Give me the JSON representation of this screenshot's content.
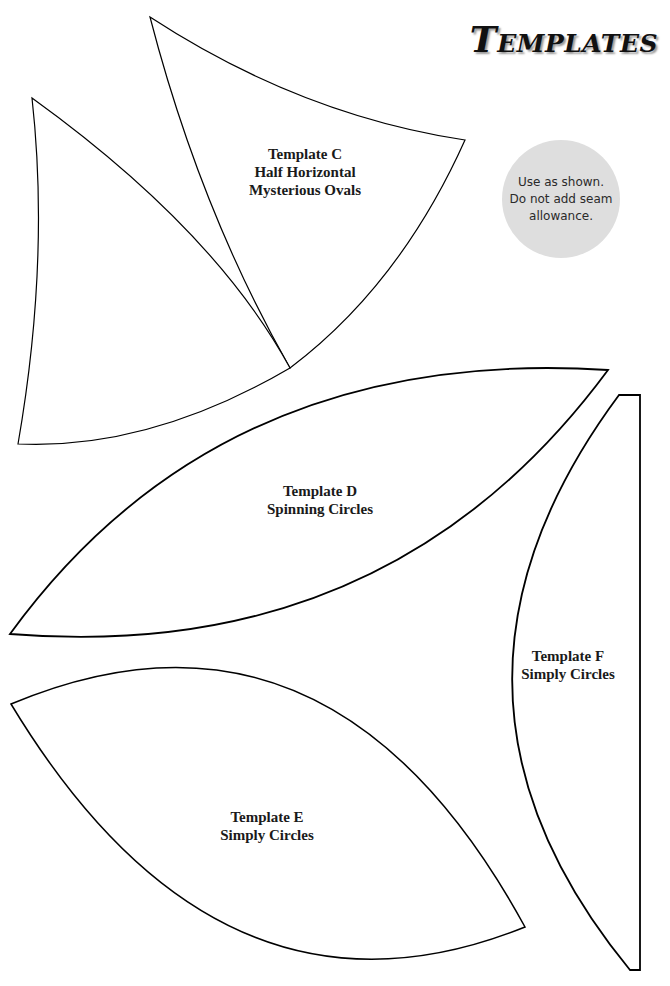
{
  "page": {
    "title": "Templates",
    "note": {
      "lines": [
        "Use as shown.",
        "Do not add seam",
        "allowance."
      ],
      "background": "#dedede"
    }
  },
  "templates": [
    {
      "id": "C",
      "name": "Template C",
      "pattern_lines": [
        "Half Horizontal",
        "Mysterious Ovals"
      ]
    },
    {
      "id": "D",
      "name": "Template D",
      "pattern_lines": [
        "Spinning Circles"
      ]
    },
    {
      "id": "E",
      "name": "Template E",
      "pattern_lines": [
        "Simply Circles"
      ]
    },
    {
      "id": "F",
      "name": "Template F",
      "pattern_lines": [
        "Simply Circles"
      ]
    }
  ],
  "colors": {
    "outline": "#000000",
    "text": "#1a1a1a",
    "title_shadow": "#9a9a9a"
  }
}
